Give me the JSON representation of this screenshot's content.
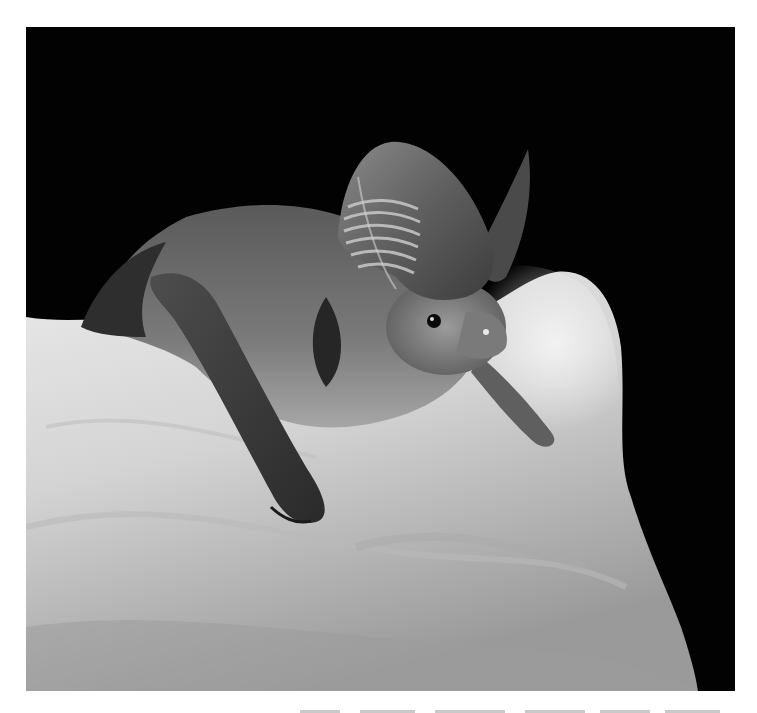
{
  "photo": {
    "alt": "Black-and-white photograph of a long-eared bat with ridged ears perched on a pale rock against a black background",
    "subject": "long-eared bat",
    "setting": "pale rock, black background",
    "tone": "grayscale",
    "colors": {
      "background": "#020202",
      "rock_light": "#e6e6e6",
      "rock_mid": "#b5b5b5",
      "fur": "#6b6b6b",
      "wing": "#3a3a3a",
      "page": "#ffffff"
    }
  },
  "caption": {
    "visible": "clipped",
    "text": ""
  }
}
